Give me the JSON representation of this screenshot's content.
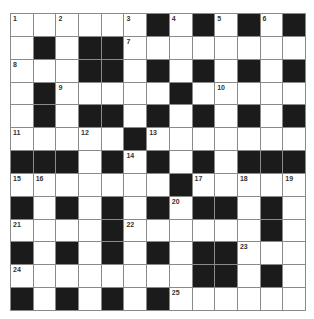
{
  "puzzle": {
    "rows": 13,
    "cols": 13,
    "colors": {
      "block": "#1b1b1b",
      "blank": "#ffffff",
      "border": "#8a8a8a",
      "number": "#333333"
    },
    "grid": [
      "......#.#.#.#",
      ".#.##........",
      "...##.#.#.#.#",
      ".#.....#.....",
      ".#.##.#.#.#.#",
      ".....#.......",
      "###.#.#.#.###",
      ".......#.....",
      "#.#.#.#.##.#.",
      "....#......#.",
      "#.#.#.#.##...",
      "........##.#.",
      "#.#.#.#......"
    ],
    "numbers": [
      {
        "r": 0,
        "c": 0,
        "n": "1"
      },
      {
        "r": 0,
        "c": 2,
        "n": "2"
      },
      {
        "r": 0,
        "c": 5,
        "n": "3"
      },
      {
        "r": 0,
        "c": 7,
        "n": "4"
      },
      {
        "r": 0,
        "c": 9,
        "n": "5"
      },
      {
        "r": 0,
        "c": 11,
        "n": "6"
      },
      {
        "r": 1,
        "c": 5,
        "n": "7"
      },
      {
        "r": 2,
        "c": 0,
        "n": "8"
      },
      {
        "r": 3,
        "c": 2,
        "n": "9"
      },
      {
        "r": 3,
        "c": 9,
        "n": "10"
      },
      {
        "r": 5,
        "c": 0,
        "n": "11"
      },
      {
        "r": 5,
        "c": 3,
        "n": "12"
      },
      {
        "r": 5,
        "c": 6,
        "n": "13"
      },
      {
        "r": 6,
        "c": 5,
        "n": "14"
      },
      {
        "r": 7,
        "c": 0,
        "n": "15"
      },
      {
        "r": 7,
        "c": 1,
        "n": "16"
      },
      {
        "r": 7,
        "c": 8,
        "n": "17"
      },
      {
        "r": 7,
        "c": 10,
        "n": "18"
      },
      {
        "r": 7,
        "c": 12,
        "n": "19"
      },
      {
        "r": 8,
        "c": 7,
        "n": "20"
      },
      {
        "r": 9,
        "c": 0,
        "n": "21"
      },
      {
        "r": 9,
        "c": 5,
        "n": "22"
      },
      {
        "r": 10,
        "c": 10,
        "n": "23"
      },
      {
        "r": 11,
        "c": 0,
        "n": "24"
      },
      {
        "r": 12,
        "c": 7,
        "n": "25"
      }
    ]
  }
}
